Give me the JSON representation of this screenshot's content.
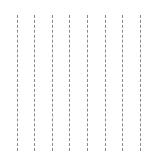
{
  "canvas": {
    "width": 161,
    "height": 158,
    "background": "#ffffff"
  },
  "lines": {
    "color": "#8a8a8a",
    "style": "dashed",
    "top": 15,
    "bottom": 151,
    "x_positions": [
      17,
      34,
      52,
      69,
      87,
      105,
      122,
      140
    ]
  }
}
